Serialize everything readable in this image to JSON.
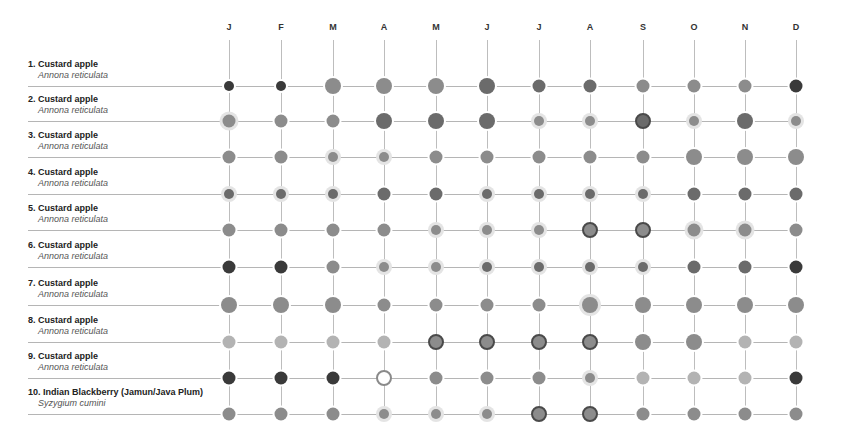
{
  "chart_data": {
    "type": "heatmap",
    "title": "",
    "subtitle": "",
    "xlabel": "",
    "ylabel": "",
    "grid": true,
    "legend": null,
    "months": [
      "J",
      "F",
      "M",
      "A",
      "M",
      "J",
      "J",
      "A",
      "S",
      "O",
      "N",
      "D"
    ],
    "encoding": {
      "tone": {
        "d": "#3a3a3a",
        "md": "#6b6b6b",
        "m": "#8c8c8c",
        "l": "#b3b3b3",
        "w": "#ffffff"
      },
      "size_px": {
        "s": 10,
        "m": 13,
        "l": 16
      },
      "ring": {
        "dark": "#4a4a4a",
        "glow": "#e4e4e4",
        "hollow": "#8a8a8a"
      },
      "cell_format": "tone-size-ring"
    },
    "rows": [
      {
        "n": "1. Custard apple",
        "sci": "Annona reticulata",
        "cells": [
          "d-s",
          "d-s",
          "m-l",
          "m-l",
          "m-l",
          "md-l",
          "md-m",
          "md-m",
          "m-m",
          "m-m",
          "m-m",
          "d-m"
        ]
      },
      {
        "n": "2. Custard apple",
        "sci": "Annona reticulata",
        "cells": [
          "m-m-glow",
          "m-m",
          "m-m",
          "md-l",
          "md-l",
          "md-l",
          "m-s-glow",
          "m-s-glow",
          "md-l-dark",
          "m-s-glow",
          "md-l",
          "m-s-glow"
        ]
      },
      {
        "n": "3. Custard apple",
        "sci": "Annona reticulata",
        "cells": [
          "m-m",
          "m-m",
          "m-s-glow",
          "m-s-glow",
          "m-m",
          "m-m",
          "m-m",
          "m-m",
          "m-m",
          "m-l",
          "m-l",
          "m-l"
        ]
      },
      {
        "n": "4. Custard apple",
        "sci": "Annona reticulata",
        "cells": [
          "md-s-glow",
          "md-s-glow",
          "md-s-glow",
          "md-m",
          "md-m",
          "md-s-glow",
          "md-s-glow",
          "md-s-glow",
          "md-s-glow",
          "md-m",
          "md-m",
          "md-m"
        ]
      },
      {
        "n": "5. Custard apple",
        "sci": "Annona reticulata",
        "cells": [
          "m-m",
          "m-m",
          "m-m",
          "m-m",
          "m-s-glow",
          "m-s-glow",
          "m-s-glow",
          "m-l-dark",
          "m-l-dark",
          "m-m-glow",
          "m-m-glow",
          "m-m"
        ]
      },
      {
        "n": "6. Custard apple",
        "sci": "Annona reticulata",
        "cells": [
          "d-m",
          "d-m",
          "m-m",
          "m-s-glow",
          "m-s-glow",
          "md-s-glow",
          "md-s-glow",
          "md-s-glow",
          "md-s-glow",
          "md-m",
          "md-m",
          "d-m"
        ]
      },
      {
        "n": "7. Custard apple",
        "sci": "Annona reticulata",
        "cells": [
          "m-l",
          "m-l",
          "m-l",
          "m-m",
          "m-m",
          "m-m",
          "m-m",
          "m-l-glow",
          "m-l",
          "m-l",
          "m-l",
          "m-l"
        ]
      },
      {
        "n": "8. Custard apple",
        "sci": "Annona reticulata",
        "cells": [
          "l-m",
          "l-m",
          "l-m",
          "l-m",
          "m-l-dark",
          "m-l-dark",
          "m-l-dark",
          "m-l-dark",
          "m-l",
          "m-l",
          "l-m",
          "l-m"
        ]
      },
      {
        "n": "9. Custard apple",
        "sci": "Annona reticulata",
        "cells": [
          "d-m",
          "d-m",
          "d-m",
          "w-l-hollow",
          "m-m",
          "m-m",
          "m-m",
          "m-s-glow",
          "l-m",
          "l-m",
          "l-m",
          "d-m"
        ]
      },
      {
        "n": "10. Indian Blackberry (Jamun/Java Plum)",
        "sci": "Syzygium cumini",
        "cells": [
          "m-m",
          "m-m",
          "m-m",
          "m-s-glow",
          "m-s-glow",
          "m-s-glow",
          "m-l-dark",
          "m-l-dark",
          "m-m",
          "m-m",
          "m-m",
          "m-m"
        ]
      }
    ]
  },
  "layout": {
    "col_x": [
      229,
      281,
      333,
      384,
      436,
      487,
      539,
      590,
      643,
      694,
      745,
      796
    ],
    "row_y": [
      86,
      121,
      157,
      194,
      230,
      267,
      305,
      342,
      378,
      414
    ],
    "grid_top": 40
  }
}
